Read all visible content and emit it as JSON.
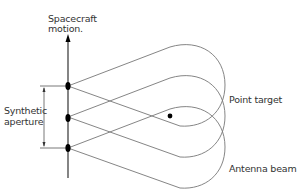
{
  "diagram": {
    "labels": {
      "spacecraft_line1": "Spacecraft",
      "spacecraft_line2": "motion.",
      "synthetic_line1": "Synthetic",
      "synthetic_line2": "aperture",
      "point_target": "Point target",
      "antenna_beam": "Antenna beam"
    },
    "colors": {
      "line": "#555555",
      "ink": "#000000"
    }
  }
}
